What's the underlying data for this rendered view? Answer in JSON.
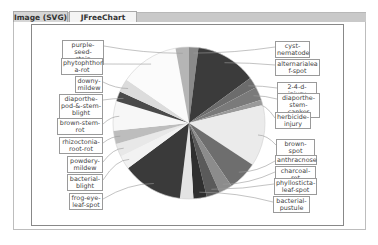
{
  "tabs": [
    {
      "label": "Image (SVG)",
      "active": false
    },
    {
      "label": "JFreeChart View",
      "active": true
    }
  ],
  "chart_data": {
    "type": "pie",
    "title": "",
    "start_angle": 90,
    "direction": "clockwise",
    "slices": [
      {
        "label": "cyst-nematode",
        "value": 14,
        "color": "#8a8a8a"
      },
      {
        "label": "alternarialeaf-spot",
        "value": 91,
        "color": "#3b3b3b"
      },
      {
        "label": "2-4-d-injury",
        "value": 16,
        "color": "#6c6c6c"
      },
      {
        "label": "diaporthe-stem-canker",
        "value": 20,
        "color": "#7a7a7a"
      },
      {
        "label": "herbicide-injury",
        "value": 8,
        "color": "#9a9a9a"
      },
      {
        "label": "brown-spot",
        "value": 92,
        "color": "#ebebeb"
      },
      {
        "label": "anthracnose",
        "value": 44,
        "color": "#6e6e6e"
      },
      {
        "label": "charcoal-rot",
        "value": 20,
        "color": "#8c8c8c"
      },
      {
        "label": "phyllosticta-leaf-spot",
        "value": 20,
        "color": "#5a5a5a"
      },
      {
        "label": "bacterial-pustule",
        "value": 20,
        "color": "#2f2f2f"
      },
      {
        "label": "frog-eye-leaf-spot-light",
        "value": 20,
        "color": "#e3e3e3"
      },
      {
        "label": "frog-eye-leaf-spot",
        "value": 91,
        "color": "#3a3a3a"
      },
      {
        "label": "bacterial-blight",
        "value": 20,
        "color": "#f2f2f2"
      },
      {
        "label": "powdery-mildew",
        "value": 20,
        "color": "#e8e8e8"
      },
      {
        "label": "rhizoctonia-root-rot",
        "value": 20,
        "color": "#bdbdbd"
      },
      {
        "label": "brown-stem-rot",
        "value": 44,
        "color": "#f7f7f7"
      },
      {
        "label": "diaporthe-pod-&-stem-blight",
        "value": 15,
        "color": "#4a4a4a"
      },
      {
        "label": "downy-mildew",
        "value": 20,
        "color": "#dcdcdc"
      },
      {
        "label": "phytophthora-rot",
        "value": 88,
        "color": "#fbfbfb"
      },
      {
        "label": "purple-seed-stain",
        "value": 20,
        "color": "#b5b5b5"
      }
    ],
    "legend": "none",
    "labels_position": "outside-with-leader-lines"
  },
  "labels": {
    "left": [
      {
        "text": "purple-seed-\nstain",
        "x": 62,
        "y": 40,
        "w": 42
      },
      {
        "text": "phytophthor\na-rot",
        "x": 61,
        "y": 58,
        "w": 42
      },
      {
        "text": "downy-\nmildew",
        "x": 75,
        "y": 76,
        "w": 28
      },
      {
        "text": "diaporthe-\npod-&-stem-\nblight",
        "x": 59,
        "y": 94,
        "w": 44
      },
      {
        "text": "brown-stem-\nrot",
        "x": 57,
        "y": 118,
        "w": 46
      },
      {
        "text": "rhizoctonia-\nroot-rot",
        "x": 59,
        "y": 137,
        "w": 44
      },
      {
        "text": "powdery-\nmildew",
        "x": 67,
        "y": 156,
        "w": 36
      },
      {
        "text": "bacterial-\nblight",
        "x": 67,
        "y": 174,
        "w": 36
      },
      {
        "text": "frog-eye-\nleaf-spot",
        "x": 69,
        "y": 193,
        "w": 34
      }
    ],
    "right": [
      {
        "text": "cyst-\nnematode",
        "x": 275,
        "y": 41,
        "w": 35
      },
      {
        "text": "alternarialea\nf-spot",
        "x": 275,
        "y": 59,
        "w": 45
      },
      {
        "text": "2-4-d-injury",
        "x": 277,
        "y": 82,
        "w": 40
      },
      {
        "text": "diaporthe-\nstem-canker",
        "x": 277,
        "y": 93,
        "w": 43
      },
      {
        "text": "herbicide-\ninjury",
        "x": 275,
        "y": 112,
        "w": 36
      },
      {
        "text": "brown-spot",
        "x": 276,
        "y": 139,
        "w": 39
      },
      {
        "text": "anthracnose",
        "x": 275,
        "y": 155,
        "w": 42
      },
      {
        "text": "charcoal-rot",
        "x": 275,
        "y": 166,
        "w": 41
      },
      {
        "text": "phyllosticta-\nleaf-spot",
        "x": 274,
        "y": 178,
        "w": 43
      },
      {
        "text": "bacterial-\npustule",
        "x": 273,
        "y": 196,
        "w": 37
      }
    ]
  }
}
